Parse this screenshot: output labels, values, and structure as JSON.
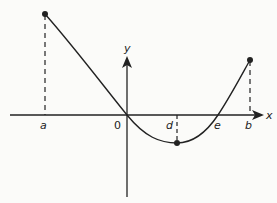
{
  "diagram": {
    "type": "function-graph",
    "axes": {
      "x_label": "x",
      "y_label": "y",
      "origin_label": "0"
    },
    "x_tick_labels": [
      "a",
      "d",
      "e",
      "b"
    ],
    "points": [
      {
        "name": "a-endpoint",
        "description": "local max at x=a"
      },
      {
        "name": "d-minimum",
        "description": "minimum at x=d"
      },
      {
        "name": "b-endpoint",
        "description": "endpoint at x=b"
      }
    ],
    "curve": "decreasing from a through origin to minimum at d, then increasing through e to b",
    "colors": {
      "line": "#222222",
      "background": "#fbfbf9"
    }
  }
}
